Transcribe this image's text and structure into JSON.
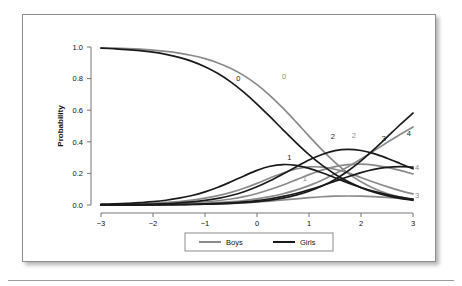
{
  "figure": {
    "background": "#ffffff",
    "border_color": "#8c8c8c"
  },
  "chart_data": {
    "type": "line",
    "title": "I cried more than usual - Boys and Girls",
    "xlabel": "Attribute",
    "ylabel": "Probability",
    "xlim": [
      -3,
      3
    ],
    "ylim": [
      0.0,
      1.0
    ],
    "xticks": [
      -3,
      -2,
      -1,
      0,
      1,
      2,
      3
    ],
    "xtick_labels": [
      "−3",
      "−2",
      "−1",
      "0",
      "1",
      "2",
      "3"
    ],
    "yticks": [
      0.0,
      0.2,
      0.4,
      0.6,
      0.8,
      1.0
    ],
    "ytick_labels": [
      "0.0",
      "0.2",
      "0.4",
      "0.6",
      "0.8",
      "1.0"
    ],
    "grid": false,
    "legend_position": "bottom-center",
    "legend": [
      {
        "name": "Boys",
        "color": "#8a8a8a"
      },
      {
        "name": "Girls",
        "color": "#1a1a1a"
      }
    ],
    "x": [
      -3.0,
      -2.75,
      -2.5,
      -2.25,
      -2.0,
      -1.75,
      -1.5,
      -1.25,
      -1.0,
      -0.75,
      -0.5,
      -0.25,
      0.0,
      0.25,
      0.5,
      0.75,
      1.0,
      1.25,
      1.5,
      1.75,
      2.0,
      2.25,
      2.5,
      2.75,
      3.0
    ],
    "series": [
      {
        "name": "Boys category 0",
        "group": "Boys",
        "category": "0",
        "color": "#8a8a8a",
        "label": "0",
        "label_x": 0.52,
        "label_y": 0.8,
        "values": [
          0.995,
          0.993,
          0.99,
          0.986,
          0.98,
          0.972,
          0.961,
          0.946,
          0.926,
          0.899,
          0.864,
          0.819,
          0.762,
          0.693,
          0.613,
          0.526,
          0.436,
          0.349,
          0.27,
          0.202,
          0.147,
          0.105,
          0.073,
          0.05,
          0.034
        ]
      },
      {
        "name": "Boys category 1",
        "group": "Boys",
        "category": "1",
        "color": "#8a8a8a",
        "label": "1",
        "label_x": 0.92,
        "label_y": 0.155,
        "values": [
          0.003,
          0.004,
          0.006,
          0.008,
          0.011,
          0.016,
          0.022,
          0.031,
          0.043,
          0.059,
          0.08,
          0.106,
          0.137,
          0.171,
          0.203,
          0.228,
          0.241,
          0.24,
          0.226,
          0.203,
          0.174,
          0.144,
          0.116,
          0.091,
          0.07
        ]
      },
      {
        "name": "Boys category 2",
        "group": "Boys",
        "category": "2",
        "color": "#8a8a8a",
        "label": "2",
        "label_x": 1.86,
        "label_y": 0.425,
        "values": [
          0.001,
          0.001,
          0.002,
          0.003,
          0.004,
          0.006,
          0.009,
          0.013,
          0.019,
          0.027,
          0.038,
          0.053,
          0.073,
          0.098,
          0.127,
          0.159,
          0.192,
          0.221,
          0.243,
          0.256,
          0.259,
          0.252,
          0.238,
          0.219,
          0.197
        ]
      },
      {
        "name": "Boys category 3",
        "group": "Boys",
        "category": "3",
        "color": "#8a8a8a",
        "label": "3",
        "label_x": 3.08,
        "label_y": 0.045,
        "values": [
          0.0004,
          0.0006,
          0.0008,
          0.0011,
          0.0015,
          0.0021,
          0.0029,
          0.004,
          0.0055,
          0.0076,
          0.0104,
          0.0141,
          0.0189,
          0.0248,
          0.0318,
          0.0392,
          0.0463,
          0.0521,
          0.0558,
          0.057,
          0.0557,
          0.0524,
          0.0478,
          0.0425,
          0.0373
        ]
      },
      {
        "name": "Boys category 4",
        "group": "Boys",
        "category": "4",
        "color": "#8a8a8a",
        "label": "4",
        "label_x": 3.08,
        "label_y": 0.222,
        "values": [
          0.0006,
          0.0009,
          0.0013,
          0.0019,
          0.0027,
          0.0038,
          0.0054,
          0.0076,
          0.0107,
          0.015,
          0.0208,
          0.0287,
          0.0393,
          0.0532,
          0.0713,
          0.0943,
          0.1227,
          0.157,
          0.197,
          0.2421,
          0.2913,
          0.343,
          0.3953,
          0.4462,
          0.4938
        ]
      },
      {
        "name": "Girls category 0",
        "group": "Girls",
        "category": "0",
        "color": "#1a1a1a",
        "label": "0",
        "label_x": -0.36,
        "label_y": 0.785,
        "values": [
          0.993,
          0.989,
          0.984,
          0.977,
          0.967,
          0.953,
          0.934,
          0.909,
          0.875,
          0.832,
          0.778,
          0.713,
          0.639,
          0.559,
          0.476,
          0.395,
          0.319,
          0.252,
          0.195,
          0.148,
          0.11,
          0.081,
          0.059,
          0.042,
          0.03
        ]
      },
      {
        "name": "Girls category 1",
        "group": "Girls",
        "category": "1",
        "color": "#1a1a1a",
        "label": "1",
        "label_x": 0.62,
        "label_y": 0.285,
        "values": [
          0.005,
          0.007,
          0.01,
          0.015,
          0.021,
          0.03,
          0.043,
          0.06,
          0.083,
          0.112,
          0.147,
          0.184,
          0.219,
          0.245,
          0.256,
          0.251,
          0.232,
          0.204,
          0.172,
          0.14,
          0.111,
          0.086,
          0.066,
          0.05,
          0.037
        ]
      },
      {
        "name": "Girls category 2",
        "group": "Girls",
        "category": "2",
        "color": "#1a1a1a",
        "label": "2",
        "label_x": 1.46,
        "label_y": 0.415,
        "values": [
          0.001,
          0.002,
          0.003,
          0.004,
          0.006,
          0.009,
          0.014,
          0.02,
          0.029,
          0.042,
          0.06,
          0.084,
          0.115,
          0.153,
          0.196,
          0.241,
          0.285,
          0.32,
          0.344,
          0.352,
          0.345,
          0.325,
          0.296,
          0.263,
          0.229
        ]
      },
      {
        "name": "Girls category 3",
        "group": "Girls",
        "category": "3",
        "color": "#1a1a1a",
        "label": "3",
        "label_x": 2.44,
        "label_y": 0.405,
        "values": [
          0.0003,
          0.0005,
          0.0007,
          0.001,
          0.0015,
          0.0022,
          0.0032,
          0.0046,
          0.0067,
          0.0097,
          0.014,
          0.02,
          0.0283,
          0.0396,
          0.0543,
          0.073,
          0.0958,
          0.122,
          0.1504,
          0.1788,
          0.2046,
          0.2251,
          0.2382,
          0.243,
          0.2398
        ]
      },
      {
        "name": "Girls category 4",
        "group": "Girls",
        "category": "4",
        "color": "#1a1a1a",
        "label": "4",
        "label_x": 2.92,
        "label_y": 0.435,
        "values": [
          0.0002,
          0.0003,
          0.0005,
          0.0007,
          0.001,
          0.0015,
          0.0022,
          0.0032,
          0.0047,
          0.0069,
          0.0101,
          0.0147,
          0.0213,
          0.0307,
          0.0439,
          0.0621,
          0.0868,
          0.1196,
          0.162,
          0.2151,
          0.2788,
          0.3514,
          0.4293,
          0.5079,
          0.5822
        ]
      }
    ]
  }
}
